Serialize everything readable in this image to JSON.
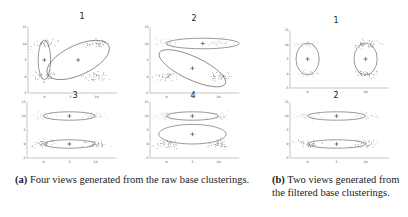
{
  "figure": {
    "subfigure_a": {
      "panels": [
        {
          "title": "1",
          "ellipses": [
            {
              "cx": 0,
              "cy": 5,
              "rx": 1.2,
              "ry": 6
            },
            {
              "cx": 6.5,
              "cy": 5,
              "rx": 6.5,
              "ry": 4.5,
              "angle": -25
            }
          ],
          "centers": [
            [
              0,
              5
            ],
            [
              6.5,
              5
            ]
          ]
        },
        {
          "title": "2",
          "ellipses": [
            {
              "cx": 7,
              "cy": 10,
              "rx": 7,
              "ry": 1.6
            },
            {
              "cx": 5,
              "cy": 2.5,
              "rx": 7,
              "ry": 3.5,
              "angle": 25
            }
          ],
          "centers": [
            [
              7,
              10
            ],
            [
              5,
              2.5
            ]
          ]
        },
        {
          "title": "3",
          "ellipses": [
            {
              "cx": 5,
              "cy": 10,
              "rx": 5,
              "ry": 1.5
            },
            {
              "cx": 5,
              "cy": 0,
              "rx": 5,
              "ry": 1.5
            }
          ],
          "centers": [
            [
              5,
              10
            ],
            [
              5,
              0
            ]
          ]
        },
        {
          "title": "4",
          "ellipses": [
            {
              "cx": 5,
              "cy": 10,
              "rx": 5,
              "ry": 1.5
            },
            {
              "cx": 5,
              "cy": 3.5,
              "rx": 6.5,
              "ry": 3.5
            }
          ],
          "centers": [
            [
              5,
              10
            ],
            [
              5,
              3.5
            ]
          ]
        }
      ],
      "caption_label": "(a)",
      "caption_text": " Four views generated from the raw base clusterings."
    },
    "subfigure_b": {
      "panels": [
        {
          "title": "1",
          "ellipses": [
            {
              "cx": 0,
              "cy": 5,
              "rx": 2,
              "ry": 5.5
            },
            {
              "cx": 10,
              "cy": 5,
              "rx": 2,
              "ry": 5.5
            }
          ],
          "centers": [
            [
              0,
              5
            ],
            [
              10,
              5
            ]
          ]
        },
        {
          "title": "2",
          "ellipses": [
            {
              "cx": 5,
              "cy": 10,
              "rx": 5,
              "ry": 1.5
            },
            {
              "cx": 5,
              "cy": 0,
              "rx": 5,
              "ry": 1.5
            }
          ],
          "centers": [
            [
              5,
              10
            ],
            [
              5,
              0
            ]
          ]
        }
      ],
      "caption_label": "(b)",
      "caption_text": " Two views generated from the filtered base clusterings."
    },
    "axes": {
      "x_ticks": [
        "0",
        "5",
        "10"
      ],
      "y_ticks": [
        "15",
        "10",
        "5",
        "0",
        "-5"
      ]
    },
    "colors": {
      "line": "#555555",
      "points": "#666666",
      "light_points": "#bbbbbb"
    }
  },
  "chart_data": [
    {
      "type": "scatter",
      "title": "1",
      "group": "a",
      "xlim": [
        -2,
        14
      ],
      "ylim": [
        -5,
        15
      ],
      "clusters": [
        {
          "x": 0,
          "y": 10
        },
        {
          "x": 0,
          "y": 0
        },
        {
          "x": 10,
          "y": 10
        },
        {
          "x": 10,
          "y": 0
        }
      ],
      "x_ticks": [
        "0",
        "5",
        "10"
      ],
      "y_ticks": [
        "-5",
        "0",
        "5",
        "10",
        "15"
      ]
    },
    {
      "type": "scatter",
      "title": "2",
      "group": "a",
      "xlim": [
        -2,
        14
      ],
      "ylim": [
        -5,
        15
      ],
      "clusters": [
        {
          "x": 0,
          "y": 10
        },
        {
          "x": 0,
          "y": 0
        },
        {
          "x": 10,
          "y": 10
        },
        {
          "x": 10,
          "y": 0
        }
      ],
      "x_ticks": [
        "0",
        "5",
        "10"
      ],
      "y_ticks": [
        "-5",
        "0",
        "5",
        "10",
        "15"
      ]
    },
    {
      "type": "scatter",
      "title": "3",
      "group": "a",
      "xlim": [
        -2,
        14
      ],
      "ylim": [
        -5,
        15
      ],
      "clusters": [
        {
          "x": 0,
          "y": 10
        },
        {
          "x": 0,
          "y": 0
        },
        {
          "x": 10,
          "y": 10
        },
        {
          "x": 10,
          "y": 0
        }
      ],
      "x_ticks": [
        "0",
        "5",
        "10"
      ],
      "y_ticks": [
        "-5",
        "0",
        "5",
        "10",
        "15"
      ]
    },
    {
      "type": "scatter",
      "title": "4",
      "group": "a",
      "xlim": [
        -2,
        14
      ],
      "ylim": [
        -5,
        15
      ],
      "clusters": [
        {
          "x": 0,
          "y": 10
        },
        {
          "x": 0,
          "y": 0
        },
        {
          "x": 10,
          "y": 10
        },
        {
          "x": 10,
          "y": 0
        }
      ],
      "x_ticks": [
        "0",
        "5",
        "10"
      ],
      "y_ticks": [
        "-5",
        "0",
        "5",
        "10",
        "15"
      ]
    },
    {
      "type": "scatter",
      "title": "1",
      "group": "b",
      "xlim": [
        -2,
        14
      ],
      "ylim": [
        -5,
        15
      ],
      "clusters": [
        {
          "x": 0,
          "y": 10
        },
        {
          "x": 0,
          "y": 0
        },
        {
          "x": 10,
          "y": 10
        },
        {
          "x": 10,
          "y": 0
        }
      ],
      "x_ticks": [
        "0",
        "5",
        "10"
      ],
      "y_ticks": [
        "-5",
        "0",
        "5",
        "10",
        "15"
      ]
    },
    {
      "type": "scatter",
      "title": "2",
      "group": "b",
      "xlim": [
        -2,
        14
      ],
      "ylim": [
        -5,
        15
      ],
      "clusters": [
        {
          "x": 0,
          "y": 10
        },
        {
          "x": 0,
          "y": 0
        },
        {
          "x": 10,
          "y": 10
        },
        {
          "x": 10,
          "y": 0
        }
      ],
      "x_ticks": [
        "0",
        "5",
        "10"
      ],
      "y_ticks": [
        "-5",
        "0",
        "5",
        "10",
        "15"
      ]
    }
  ]
}
